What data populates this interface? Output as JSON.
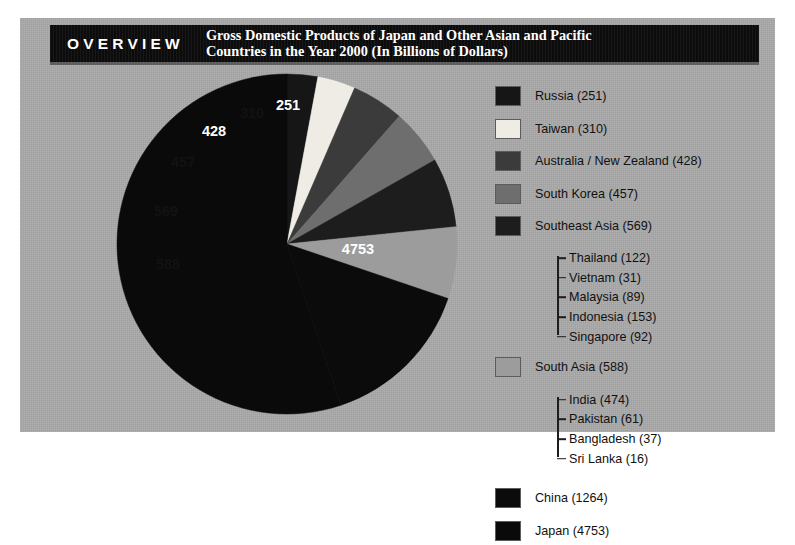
{
  "header": {
    "badge": "OVERVIEW",
    "title": "Gross Domestic Products of Japan and Other Asian and Pacific\nCountries in the Year 2000 (In Billions of Dollars)"
  },
  "chart_data": {
    "type": "pie",
    "title": "Gross Domestic Products of Japan and Other Asian and Pacific Countries in the Year 2000 (In Billions of Dollars)",
    "unit": "Billions of Dollars",
    "year": "2000",
    "total": 8620,
    "legend_position": "right",
    "start_angle_deg": 0,
    "direction": "clockwise",
    "categories": [
      "Russia",
      "Taiwan",
      "Australia / New Zealand",
      "South Korea",
      "Southeast Asia",
      "South Asia",
      "China",
      "Japan"
    ],
    "values": [
      251,
      310,
      428,
      457,
      569,
      588,
      1264,
      4753
    ],
    "colors": [
      "#161616",
      "#eeece4",
      "#3b3b3b",
      "#6e6e6e",
      "#1d1d1d",
      "#9c9c9c",
      "#0b0b0b",
      "#0a0a0a"
    ],
    "slice_label_colors": [
      "light",
      "dark",
      "light",
      "dark",
      "dark",
      "dark",
      "light",
      "light"
    ],
    "slice_labels": [
      "251",
      "310",
      "428",
      "457",
      "569",
      "588",
      "1264",
      "4753"
    ],
    "visible_slice_labels": [
      "251",
      "310",
      "428",
      "457",
      "569",
      "588",
      "4753"
    ],
    "subgroups": {
      "Southeast Asia": {
        "categories": [
          "Thailand",
          "Vietnam",
          "Malaysia",
          "Indonesia",
          "Singapore"
        ],
        "values": [
          122,
          31,
          89,
          153,
          92
        ]
      },
      "South Asia": {
        "categories": [
          "India",
          "Pakistan",
          "Bangladesh",
          "Sri Lanka"
        ],
        "values": [
          474,
          61,
          37,
          16
        ]
      }
    }
  },
  "legend": {
    "entries": [
      {
        "label": "Russia (251)",
        "color": "#161616",
        "name": "russia"
      },
      {
        "label": "Taiwan (310)",
        "color": "#eeece4",
        "name": "taiwan"
      },
      {
        "label": "Australia / New Zealand (428)",
        "color": "#3b3b3b",
        "name": "australia-new-zealand"
      },
      {
        "label": "South Korea (457)",
        "color": "#6e6e6e",
        "name": "south-korea"
      },
      {
        "label": "Southeast Asia (569)",
        "color": "#1d1d1d",
        "name": "southeast-asia"
      },
      {
        "label": "South Asia (588)",
        "color": "#9c9c9c",
        "name": "south-asia"
      },
      {
        "label": "China (1264)",
        "color": "#0b0b0b",
        "name": "china"
      },
      {
        "label": "Japan (4753)",
        "color": "#0a0a0a",
        "name": "japan"
      }
    ],
    "southeast_asia_children": [
      "Thailand (122)",
      "Vietnam (31)",
      "Malaysia (89)",
      "Indonesia (153)",
      "Singapore (92)"
    ],
    "south_asia_children": [
      "India (474)",
      "Pakistan (61)",
      "Bangladesh (37)",
      "Sri Lanka (16)"
    ]
  },
  "pie_labels": [
    {
      "text": "251",
      "x": 288,
      "y": 110,
      "tone": "light"
    },
    {
      "text": "310",
      "x": 252,
      "y": 118,
      "tone": "dark"
    },
    {
      "text": "428",
      "x": 214,
      "y": 136,
      "tone": "light"
    },
    {
      "text": "457",
      "x": 183,
      "y": 167,
      "tone": "dark"
    },
    {
      "text": "569",
      "x": 166,
      "y": 216,
      "tone": "dark"
    },
    {
      "text": "588",
      "x": 168,
      "y": 269,
      "tone": "dark"
    },
    {
      "text": "4753",
      "x": 358,
      "y": 254,
      "tone": "light"
    }
  ]
}
